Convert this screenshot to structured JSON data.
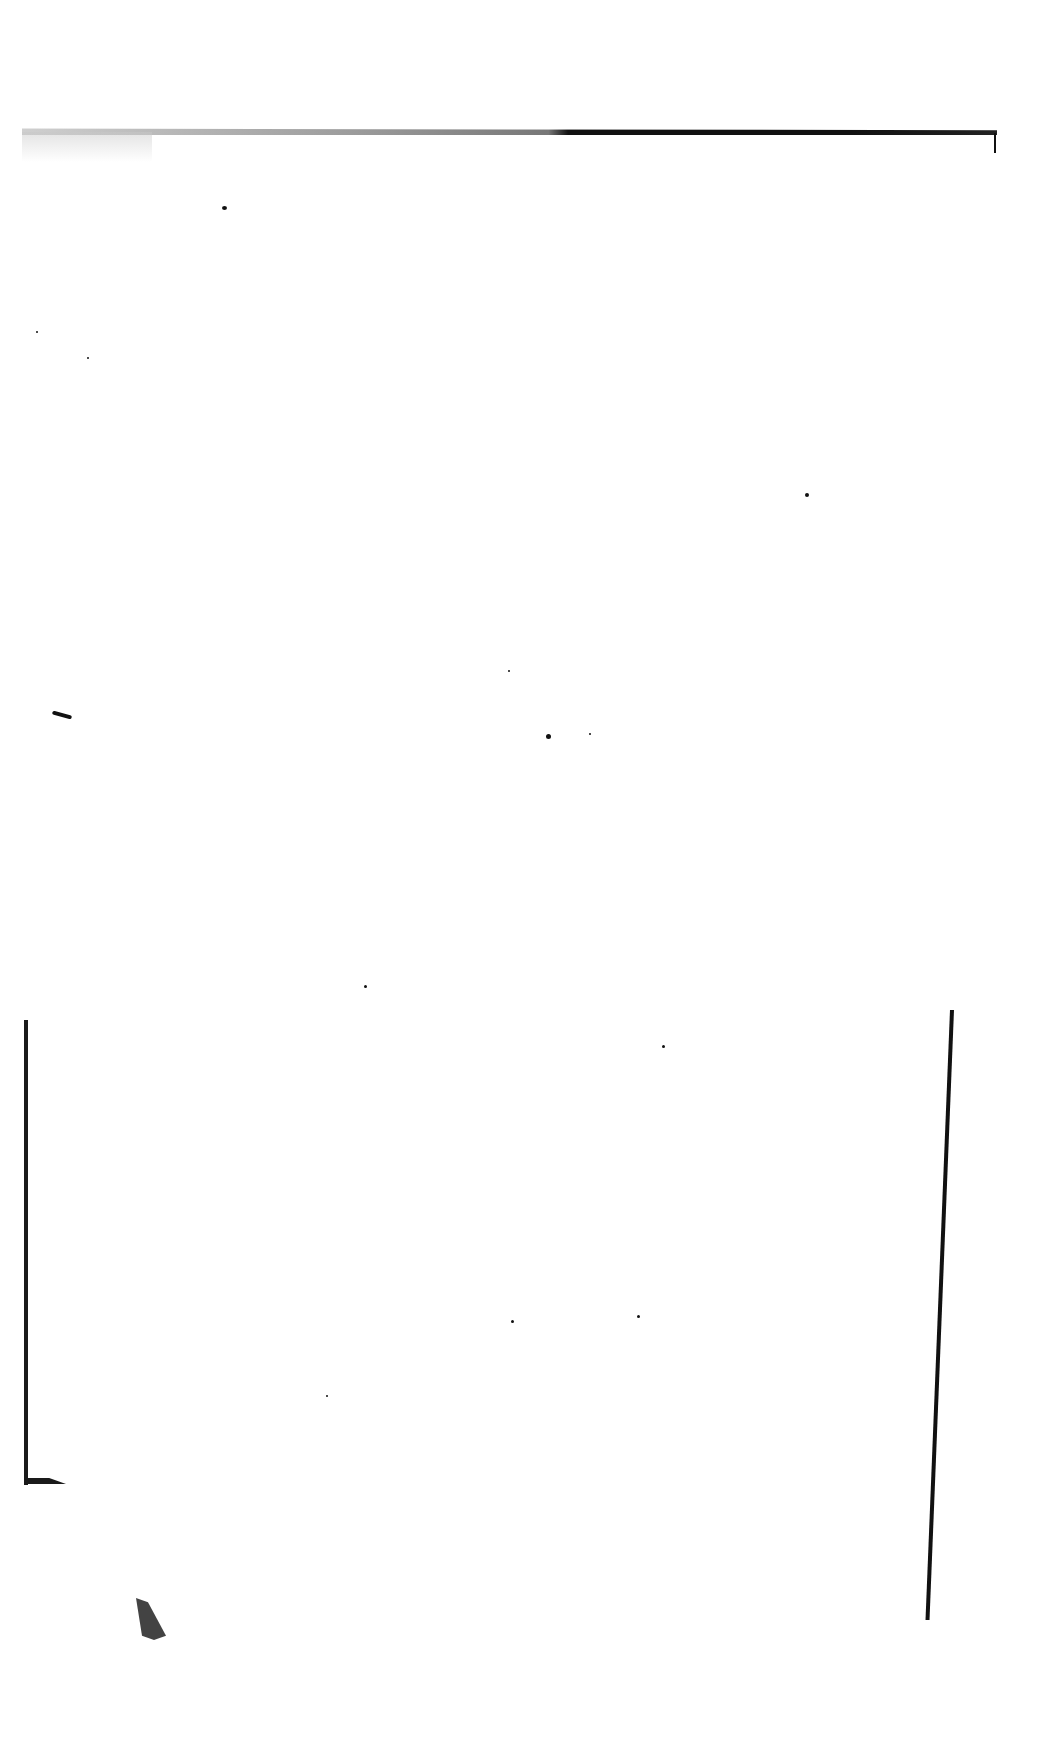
{
  "page": {
    "type": "scanned-blank-page",
    "text": "",
    "background_color": "#ffffff",
    "artifact_color": "#111111"
  }
}
